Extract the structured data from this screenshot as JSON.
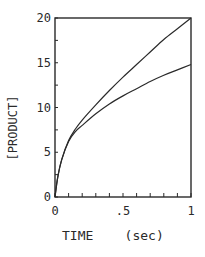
{
  "chart_data": {
    "type": "line",
    "title": "",
    "xlabel": "TIME    (sec)",
    "ylabel": "[PRODUCT]",
    "xlim": [
      0,
      1
    ],
    "ylim": [
      0,
      20
    ],
    "x_ticks": [
      0,
      0.5,
      1
    ],
    "x_tick_labels": [
      "0",
      ".5",
      "1"
    ],
    "x_minor_ticks": [
      0.1,
      0.2,
      0.3,
      0.4,
      0.6,
      0.7,
      0.8,
      0.9
    ],
    "y_ticks": [
      0,
      5,
      10,
      15,
      20
    ],
    "y_tick_labels": [
      "0",
      "5",
      "10",
      "15",
      "20"
    ],
    "y_minor_ticks": [
      2.5,
      7.5,
      12.5,
      17.5
    ],
    "grid": false,
    "legend": null,
    "series": [
      {
        "name": "upper curve",
        "x": [
          0,
          0.02,
          0.05,
          0.1,
          0.15,
          0.2,
          0.3,
          0.4,
          0.5,
          0.6,
          0.7,
          0.8,
          0.9,
          1.0
        ],
        "y": [
          0,
          2.2,
          4.2,
          6.3,
          7.6,
          8.6,
          10.3,
          11.9,
          13.4,
          14.8,
          16.2,
          17.6,
          18.8,
          20.0
        ]
      },
      {
        "name": "lower curve",
        "x": [
          0,
          0.02,
          0.05,
          0.1,
          0.15,
          0.2,
          0.3,
          0.4,
          0.5,
          0.6,
          0.7,
          0.8,
          0.9,
          1.0
        ],
        "y": [
          0,
          2.2,
          4.2,
          6.2,
          7.3,
          8.0,
          9.3,
          10.4,
          11.3,
          12.1,
          12.9,
          13.6,
          14.2,
          14.8
        ]
      }
    ]
  },
  "axes": {
    "xlabel": "TIME    (sec)",
    "ylabel": "[PRODUCT]"
  }
}
